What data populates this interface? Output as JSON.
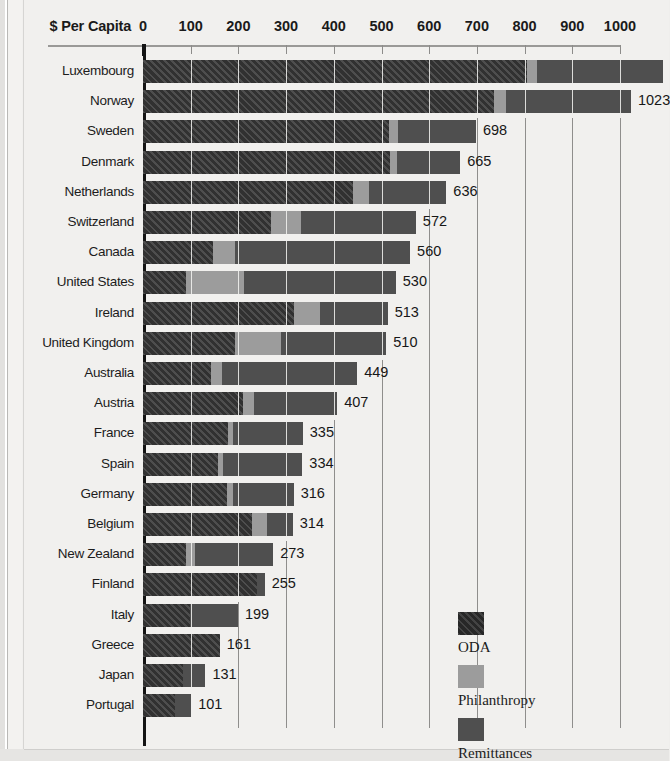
{
  "chart_data": {
    "type": "bar",
    "subtype": "stacked-horizontal",
    "title": "",
    "xlabel": "$ Per Capita",
    "ylabel": "",
    "xlim": [
      0,
      1000
    ],
    "xticks": [
      0,
      100,
      200,
      300,
      400,
      500,
      600,
      700,
      800,
      900,
      1000
    ],
    "grid": true,
    "legend_position": "bottom-right",
    "series": [
      {
        "name": "ODA",
        "color": "#3a3a3a"
      },
      {
        "name": "Philanthropy",
        "color": "#9c9c9c"
      },
      {
        "name": "Remittances",
        "color": "#4f4f4f"
      }
    ],
    "categories": [
      "Luxembourg",
      "Norway",
      "Sweden",
      "Denmark",
      "Netherlands",
      "Switzerland",
      "Canada",
      "United States",
      "Ireland",
      "United Kingdom",
      "Australia",
      "Austria",
      "France",
      "Spain",
      "Germany",
      "Belgium",
      "New Zealand",
      "Finland",
      "Italy",
      "Greece",
      "Japan",
      "Portugal"
    ],
    "rows": [
      {
        "country": "Luxembourg",
        "oda": 806,
        "philanthropy": 20,
        "remittances": 264,
        "total": 1090,
        "total_label": "",
        "truncated": true
      },
      {
        "country": "Norway",
        "oda": 736,
        "philanthropy": 25,
        "remittances": 262,
        "total": 1023,
        "total_label": "1023",
        "truncated": false
      },
      {
        "country": "Sweden",
        "oda": 516,
        "philanthropy": 18,
        "remittances": 164,
        "total": 698,
        "total_label": "698",
        "truncated": false
      },
      {
        "country": "Denmark",
        "oda": 518,
        "philanthropy": 14,
        "remittances": 133,
        "total": 665,
        "total_label": "665",
        "truncated": false
      },
      {
        "country": "Netherlands",
        "oda": 440,
        "philanthropy": 34,
        "remittances": 162,
        "total": 636,
        "total_label": "636",
        "truncated": false
      },
      {
        "country": "Switzerland",
        "oda": 268,
        "philanthropy": 63,
        "remittances": 241,
        "total": 572,
        "total_label": "572",
        "truncated": false
      },
      {
        "country": "Canada",
        "oda": 147,
        "philanthropy": 46,
        "remittances": 367,
        "total": 560,
        "total_label": "560",
        "truncated": false
      },
      {
        "country": "United States",
        "oda": 90,
        "philanthropy": 122,
        "remittances": 318,
        "total": 530,
        "total_label": "530",
        "truncated": false
      },
      {
        "country": "Ireland",
        "oda": 316,
        "philanthropy": 55,
        "remittances": 142,
        "total": 513,
        "total_label": "513",
        "truncated": false
      },
      {
        "country": "United Kingdom",
        "oda": 193,
        "philanthropy": 96,
        "remittances": 221,
        "total": 510,
        "total_label": "510",
        "truncated": false
      },
      {
        "country": "Australia",
        "oda": 143,
        "philanthropy": 22,
        "remittances": 284,
        "total": 449,
        "total_label": "449",
        "truncated": false
      },
      {
        "country": "Austria",
        "oda": 210,
        "philanthropy": 23,
        "remittances": 174,
        "total": 407,
        "total_label": "407",
        "truncated": false
      },
      {
        "country": "France",
        "oda": 178,
        "philanthropy": 11,
        "remittances": 146,
        "total": 335,
        "total_label": "335",
        "truncated": false
      },
      {
        "country": "Spain",
        "oda": 157,
        "philanthropy": 11,
        "remittances": 166,
        "total": 334,
        "total_label": "334",
        "truncated": false
      },
      {
        "country": "Germany",
        "oda": 176,
        "philanthropy": 12,
        "remittances": 128,
        "total": 316,
        "total_label": "316",
        "truncated": false
      },
      {
        "country": "Belgium",
        "oda": 228,
        "philanthropy": 33,
        "remittances": 53,
        "total": 314,
        "total_label": "314",
        "truncated": false
      },
      {
        "country": "New Zealand",
        "oda": 90,
        "philanthropy": 20,
        "remittances": 163,
        "total": 273,
        "total_label": "273",
        "truncated": false
      },
      {
        "country": "Finland",
        "oda": 238,
        "philanthropy": 0,
        "remittances": 17,
        "total": 255,
        "total_label": "255",
        "truncated": false
      },
      {
        "country": "Italy",
        "oda": 99,
        "philanthropy": 0,
        "remittances": 100,
        "total": 199,
        "total_label": "199",
        "truncated": false
      },
      {
        "country": "Greece",
        "oda": 161,
        "philanthropy": 0,
        "remittances": 0,
        "total": 161,
        "total_label": "161",
        "truncated": false
      },
      {
        "country": "Japan",
        "oda": 84,
        "philanthropy": 0,
        "remittances": 47,
        "total": 131,
        "total_label": "131",
        "truncated": false
      },
      {
        "country": "Portugal",
        "oda": 67,
        "philanthropy": 0,
        "remittances": 34,
        "total": 101,
        "total_label": "101",
        "truncated": false
      }
    ]
  },
  "axis": {
    "title": "$ Per Capita",
    "ticks": [
      "0",
      "100",
      "200",
      "300",
      "400",
      "500",
      "600",
      "700",
      "800",
      "900",
      "1000"
    ]
  },
  "legend": {
    "items": [
      {
        "label": "ODA",
        "color": "#2e2e2e"
      },
      {
        "label": "Philanthropy",
        "color": "#9c9c9c"
      },
      {
        "label": "Remittances",
        "color": "#4f4f4f"
      }
    ]
  }
}
